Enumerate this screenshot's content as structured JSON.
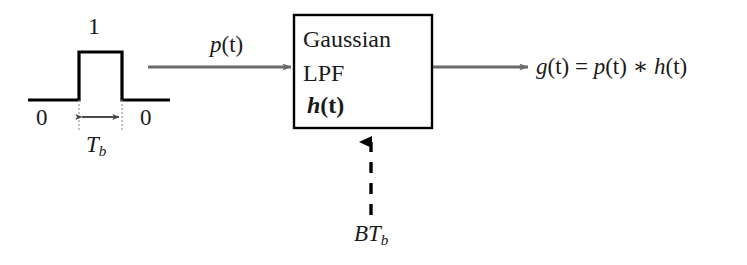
{
  "diagram": {
    "colors": {
      "signal_line": "#000000",
      "arrow": "#6a6a6a",
      "block_border": "#000000",
      "dashed_arrow": "#000000",
      "text": "#1a1a1a",
      "background": "#ffffff"
    },
    "input_pulse": {
      "amplitude_label": "1",
      "zero_left_label": "0",
      "zero_right_label": "0",
      "duration_symbol": "T",
      "duration_subscript": "b",
      "duration_label": "Tb"
    },
    "input_signal": {
      "label": "p(t)",
      "label_base": "p",
      "label_arg": "(t)"
    },
    "block": {
      "line1": "Gaussian",
      "line2": "LPF",
      "line3_base": "h",
      "line3_arg": "(t)",
      "line3": "h(t)"
    },
    "control_input": {
      "symbol_b": "B",
      "symbol_t": "T",
      "subscript": "b",
      "label": "BTb"
    },
    "output_signal": {
      "equation": "g(t) = p(t) * h(t)",
      "lhs": "g",
      "lhs_arg": "(t)",
      "equals": " = ",
      "rhs_first": "p",
      "rhs_first_arg": "(t)",
      "convolution_operator": " ∗ ",
      "rhs_second": "h",
      "rhs_second_arg": "(t)"
    }
  }
}
